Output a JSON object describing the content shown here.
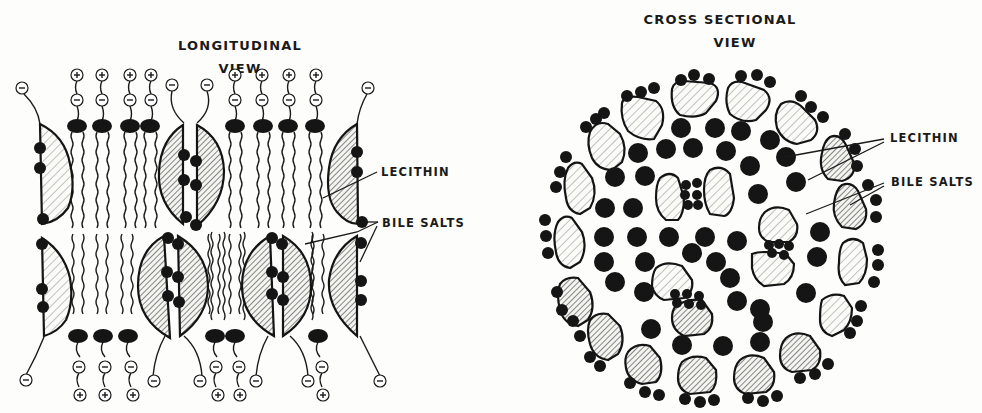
{
  "figure": {
    "left_panel": {
      "title_line1": "LONGITUDINAL",
      "title_line2": "VIEW",
      "labels": {
        "lecithin": "LECITHIN",
        "bile_salts": "BILE SALTS"
      },
      "top_row": {
        "lecithin_heads": 8,
        "bile_salt_units": 4,
        "charge_symbols": {
          "plus": "+",
          "minus": "−"
        }
      },
      "bottom_row": {
        "lecithin_heads": 6,
        "bile_salt_units": 5
      }
    },
    "right_panel": {
      "title_line1": "CROSS SECTIONAL",
      "title_line2": "VIEW",
      "labels": {
        "lecithin": "LECITHIN",
        "bile_salts": "BILE SALTS"
      }
    },
    "colors": {
      "ink": "#151515",
      "background": "#fdfdfb"
    }
  }
}
